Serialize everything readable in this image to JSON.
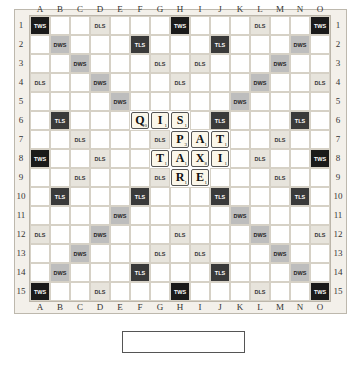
{
  "columns": [
    "A",
    "B",
    "C",
    "D",
    "E",
    "F",
    "G",
    "H",
    "I",
    "J",
    "K",
    "L",
    "M",
    "N",
    "O"
  ],
  "rows": [
    "1",
    "2",
    "3",
    "4",
    "5",
    "6",
    "7",
    "8",
    "9",
    "10",
    "11",
    "12",
    "13",
    "14",
    "15"
  ],
  "premium_layout": [
    [
      "TWS",
      "",
      "",
      "DLS",
      "",
      "",
      "",
      "TWS",
      "",
      "",
      "",
      "DLS",
      "",
      "",
      "TWS"
    ],
    [
      "",
      "DWS",
      "",
      "",
      "",
      "TLS",
      "",
      "",
      "",
      "TLS",
      "",
      "",
      "",
      "DWS",
      ""
    ],
    [
      "",
      "",
      "DWS",
      "",
      "",
      "",
      "DLS",
      "",
      "DLS",
      "",
      "",
      "",
      "DWS",
      "",
      ""
    ],
    [
      "DLS",
      "",
      "",
      "DWS",
      "",
      "",
      "",
      "DLS",
      "",
      "",
      "",
      "DWS",
      "",
      "",
      "DLS"
    ],
    [
      "",
      "",
      "",
      "",
      "DWS",
      "",
      "",
      "",
      "",
      "",
      "DWS",
      "",
      "",
      "",
      ""
    ],
    [
      "",
      "TLS",
      "",
      "",
      "",
      "TLS",
      "",
      "",
      "",
      "TLS",
      "",
      "",
      "",
      "TLS",
      ""
    ],
    [
      "",
      "",
      "DLS",
      "",
      "",
      "",
      "DLS",
      "",
      "DLS",
      "",
      "",
      "",
      "DLS",
      "",
      ""
    ],
    [
      "TWS",
      "",
      "",
      "DLS",
      "",
      "",
      "",
      "",
      "",
      "",
      "",
      "DLS",
      "",
      "",
      "TWS"
    ],
    [
      "",
      "",
      "DLS",
      "",
      "",
      "",
      "DLS",
      "",
      "DLS",
      "",
      "",
      "",
      "DLS",
      "",
      ""
    ],
    [
      "",
      "TLS",
      "",
      "",
      "",
      "TLS",
      "",
      "",
      "",
      "TLS",
      "",
      "",
      "",
      "TLS",
      ""
    ],
    [
      "",
      "",
      "",
      "",
      "DWS",
      "",
      "",
      "",
      "",
      "",
      "DWS",
      "",
      "",
      "",
      ""
    ],
    [
      "DLS",
      "",
      "",
      "DWS",
      "",
      "",
      "",
      "DLS",
      "",
      "",
      "",
      "DWS",
      "",
      "",
      "DLS"
    ],
    [
      "",
      "",
      "DWS",
      "",
      "",
      "",
      "DLS",
      "",
      "DLS",
      "",
      "",
      "",
      "DWS",
      "",
      ""
    ],
    [
      "",
      "DWS",
      "",
      "",
      "",
      "TLS",
      "",
      "",
      "",
      "TLS",
      "",
      "",
      "",
      "DWS",
      ""
    ],
    [
      "TWS",
      "",
      "",
      "DLS",
      "",
      "",
      "",
      "TWS",
      "",
      "",
      "",
      "DLS",
      "",
      "",
      "TWS"
    ]
  ],
  "tiles": [
    {
      "row": 6,
      "col": 6,
      "letter": "Q",
      "points": "10"
    },
    {
      "row": 6,
      "col": 7,
      "letter": "I",
      "points": "1"
    },
    {
      "row": 6,
      "col": 8,
      "letter": "S",
      "points": "1"
    },
    {
      "row": 7,
      "col": 8,
      "letter": "P",
      "points": "3"
    },
    {
      "row": 7,
      "col": 9,
      "letter": "A",
      "points": "1"
    },
    {
      "row": 7,
      "col": 10,
      "letter": "T",
      "points": "1"
    },
    {
      "row": 8,
      "col": 7,
      "letter": "T",
      "points": "1"
    },
    {
      "row": 8,
      "col": 8,
      "letter": "A",
      "points": "1"
    },
    {
      "row": 8,
      "col": 9,
      "letter": "X",
      "points": "8"
    },
    {
      "row": 8,
      "col": 10,
      "letter": "I",
      "points": "1"
    },
    {
      "row": 9,
      "col": 8,
      "letter": "R",
      "points": "1"
    },
    {
      "row": 9,
      "col": 9,
      "letter": "E",
      "points": "1"
    }
  ],
  "colors": {
    "TWS": "#1a1a1a",
    "TLS": "#3a3a3a",
    "DWS": "#bdbdbd",
    "DLS": "#e7e4dc",
    "tile": "#fbf7ea"
  }
}
